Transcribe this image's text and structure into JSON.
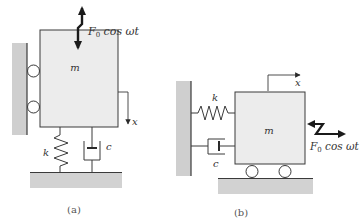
{
  "colors": {
    "stroke": "#3a3a3a",
    "wall_fill": "#cfcfcf",
    "mass_fill": "#ececec",
    "ground_fill": "#d2d2d2",
    "text": "#333333"
  },
  "panel_a": {
    "caption": "(a)",
    "mass_label": "m",
    "spring_label": "k",
    "damper_label": "c",
    "displacement_label": "x",
    "force_label": {
      "symbol": "F",
      "subscript": "0",
      "rest": " cos ωt"
    },
    "force_direction": "vertical",
    "motion_direction": "down"
  },
  "panel_b": {
    "caption": "(b)",
    "mass_label": "m",
    "spring_label": "k",
    "damper_label": "c",
    "displacement_label": "x",
    "force_label": {
      "symbol": "F",
      "subscript": "0",
      "rest": " cos ωt"
    },
    "force_direction": "horizontal",
    "motion_direction": "right"
  }
}
